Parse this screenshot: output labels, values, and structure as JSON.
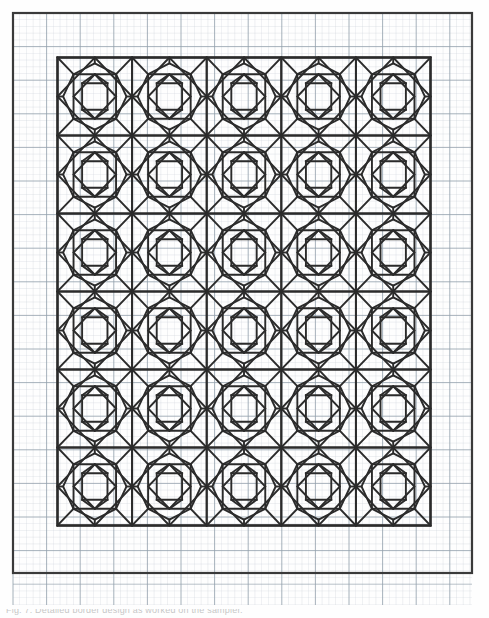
{
  "document": {
    "type": "counted-thread embroidery pattern chart",
    "title": "Geometric star motif repeat chart",
    "medium": "graph paper worksheet",
    "caption_partial": "Fig. 7. Detailed border design as worked on the sampler."
  },
  "colors": {
    "page_background": "#fefefe",
    "graph_grid_minor": "#c6cdd6",
    "graph_grid_major": "#93a0ad",
    "sheet_frame": "#3a3a3a",
    "pattern_ink": "#2b2b2b",
    "caption_text": "#9a9a9a"
  },
  "sheet": {
    "name": "graph-paper-sheet",
    "frame": {
      "x": 13,
      "y": 13,
      "width": 459,
      "height": 560,
      "stroke_width": 2.2
    },
    "grid": {
      "cell": 6.72,
      "major_every": 5,
      "minor_stroke": 0.5,
      "major_stroke": 0.9,
      "minor_opacity": 0.55,
      "major_opacity": 0.9
    },
    "bottom_band": {
      "label": "trimmed-sheet-remainder",
      "y": 575,
      "height": 30,
      "rows": 4
    }
  },
  "pattern": {
    "name": "star-motif-repeat",
    "border_box": {
      "x": 57.5,
      "y": 57.5,
      "width": 373,
      "height": 468,
      "stroke_width": 2.4
    },
    "columns": 5,
    "rows": 6,
    "block_width": 74.6,
    "block_height": 78.0,
    "stroke_width": 1.9,
    "stroke_color": "#2b2b2b"
  },
  "chart_data": {
    "type": "table",
    "xlabel": "grid columns",
    "ylabel": "grid rows",
    "grid": true,
    "legend": "none",
    "categories": [
      "col 1",
      "col 2",
      "col 3",
      "col 4",
      "col 5"
    ],
    "series": [
      {
        "name": "row 1",
        "values": [
          1,
          1,
          1,
          1,
          1
        ]
      },
      {
        "name": "row 2",
        "values": [
          1,
          1,
          1,
          1,
          1
        ]
      },
      {
        "name": "row 3",
        "values": [
          1,
          1,
          1,
          1,
          1
        ]
      },
      {
        "name": "row 4",
        "values": [
          1,
          1,
          1,
          1,
          1
        ]
      },
      {
        "name": "row 5",
        "values": [
          1,
          1,
          1,
          1,
          1
        ]
      },
      {
        "name": "row 6",
        "values": [
          1,
          1,
          1,
          1,
          1
        ]
      }
    ],
    "motif_units_total": 30,
    "graph_cells_across": 68,
    "graph_cells_down": 83,
    "annotations": []
  }
}
